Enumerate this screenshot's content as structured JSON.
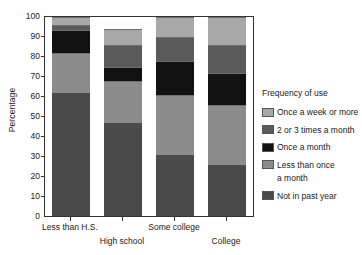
{
  "chart_data": {
    "type": "bar",
    "subtype": "stacked-bar-100",
    "title": "",
    "xlabel": "",
    "ylabel": "Percentage",
    "ylim": [
      0,
      100
    ],
    "yticks": [
      0,
      10,
      20,
      30,
      40,
      50,
      60,
      70,
      80,
      90,
      100
    ],
    "grid": false,
    "legend_position": "right",
    "legend_title": "Frequency of use",
    "categories": [
      "Less than H.S.",
      "High school",
      "Some college",
      "College"
    ],
    "series": [
      {
        "name": "Not in past year",
        "color": "#4a4a4a",
        "values": [
          62,
          47,
          31,
          26
        ]
      },
      {
        "name": "Less than once a month",
        "color": "#8c8c8c",
        "values": [
          20,
          21,
          30,
          30
        ]
      },
      {
        "name": "Once a month",
        "color": "#111111",
        "values": [
          11.5,
          7,
          17,
          16
        ]
      },
      {
        "name": "2 or 3 times a month",
        "color": "#5a5a5a",
        "values": [
          2.5,
          11,
          12,
          14
        ]
      },
      {
        "name": "Once a week or more",
        "color": "#a8a8a8",
        "values": [
          4,
          8,
          10,
          14
        ]
      }
    ],
    "cumulative_tops": {
      "Less than H.S.": [
        62,
        82,
        93.5,
        96,
        100
      ],
      "High school": [
        47,
        68,
        75,
        86,
        94
      ],
      "Some college": [
        31,
        61,
        78,
        90,
        100
      ],
      "College": [
        26,
        56,
        72,
        86,
        100
      ]
    },
    "legend_entries": [
      {
        "label": "Once a week or more",
        "label_line2": "",
        "color": "#a8a8a8"
      },
      {
        "label": "2 or 3 times a month",
        "label_line2": "",
        "color": "#5a5a5a"
      },
      {
        "label": "Once a month",
        "label_line2": "",
        "color": "#111111"
      },
      {
        "label": "Less than once",
        "label_line2": "a month",
        "color": "#8c8c8c"
      },
      {
        "label": "Not in past year",
        "label_line2": "",
        "color": "#4a4a4a"
      }
    ]
  },
  "axis": {
    "y_title": "Percentage",
    "y_tick_labels": [
      "0",
      "10",
      "20",
      "30",
      "40",
      "50",
      "60",
      "70",
      "80",
      "90",
      "100"
    ],
    "x_tick_labels": [
      "Less than H.S.",
      "High school",
      "Some college",
      "College"
    ]
  },
  "legend": {
    "title": "Frequency of use",
    "items": [
      {
        "line1": "Once a week or more",
        "line2": ""
      },
      {
        "line1": "2 or 3 times a month",
        "line2": ""
      },
      {
        "line1": "Once a month",
        "line2": ""
      },
      {
        "line1": "Less than once",
        "line2": "a month"
      },
      {
        "line1": "Not in past year",
        "line2": ""
      }
    ]
  }
}
